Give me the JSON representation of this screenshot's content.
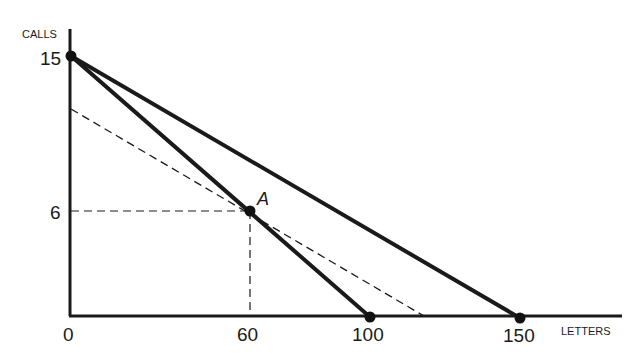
{
  "diagram": {
    "type": "budget-constraint",
    "y_axis_label": "CALLS",
    "x_axis_label": "LETTERS",
    "y_ticks": [
      {
        "label": "15",
        "value": 15
      },
      {
        "label": "6",
        "value": 6
      }
    ],
    "x_ticks": [
      {
        "label": "0",
        "value": 0
      },
      {
        "label": "60",
        "value": 60
      },
      {
        "label": "100",
        "value": 100
      },
      {
        "label": "150",
        "value": 150
      }
    ],
    "point_labels": {
      "A": "A"
    },
    "lines": [
      {
        "name": "budget-line-steep",
        "style": "solid-thick",
        "from": [
          0,
          15
        ],
        "to": [
          100,
          0
        ]
      },
      {
        "name": "budget-line-flat",
        "style": "solid-thick",
        "from": [
          0,
          15
        ],
        "to": [
          150,
          0
        ]
      },
      {
        "name": "dashed-parallel-line",
        "style": "dashed",
        "from": [
          0,
          10.2
        ],
        "through": [
          60,
          6
        ],
        "to": [
          118,
          0
        ]
      },
      {
        "name": "guide-horizontal",
        "style": "dashed",
        "from": [
          0,
          6
        ],
        "to": [
          60,
          6
        ]
      },
      {
        "name": "guide-vertical",
        "style": "dashed",
        "from": [
          60,
          0
        ],
        "to": [
          60,
          6
        ]
      }
    ],
    "points": [
      {
        "name": "point-0-15",
        "x": 0,
        "y": 15
      },
      {
        "name": "point-A",
        "label": "A",
        "x": 60,
        "y": 6
      },
      {
        "name": "point-100-0",
        "x": 100,
        "y": 0
      },
      {
        "name": "point-150-0",
        "x": 150,
        "y": 0
      }
    ],
    "colors": {
      "ink": "#1a1a1a",
      "background": "#ffffff"
    }
  }
}
